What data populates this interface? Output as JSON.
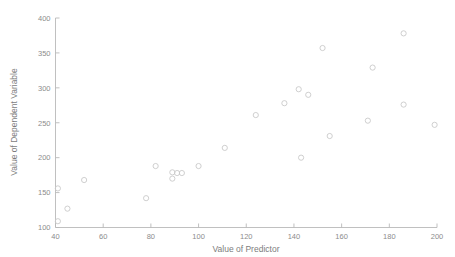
{
  "figure": {
    "background_color": "#ffffff",
    "axis_color": "#b9b9b9",
    "marker_color": "#c9c9c9",
    "tick_label_color": "#8c8c8c"
  },
  "chart_data": {
    "type": "scatter",
    "title": "",
    "xlabel": "Value of Predictor",
    "ylabel": "Value of Dependent Variable",
    "xlim": [
      40,
      200
    ],
    "ylim": [
      100,
      400
    ],
    "xticks": [
      40,
      60,
      80,
      100,
      120,
      140,
      160,
      180,
      200
    ],
    "xtick_labels": [
      "40",
      "60",
      "80",
      "100",
      "120",
      "140",
      "160",
      "180",
      "200"
    ],
    "yticks": [
      100,
      150,
      200,
      250,
      300,
      350,
      400
    ],
    "ytick_labels": [
      "100",
      "150",
      "200",
      "250",
      "300",
      "350",
      "400"
    ],
    "grid": false,
    "legend": false,
    "marker_style": "open-circle",
    "points": [
      {
        "x": 41,
        "y": 109
      },
      {
        "x": 41,
        "y": 156
      },
      {
        "x": 45,
        "y": 127
      },
      {
        "x": 52,
        "y": 168
      },
      {
        "x": 78,
        "y": 142
      },
      {
        "x": 82,
        "y": 188
      },
      {
        "x": 89,
        "y": 170
      },
      {
        "x": 89,
        "y": 179
      },
      {
        "x": 91,
        "y": 178
      },
      {
        "x": 93,
        "y": 178
      },
      {
        "x": 100,
        "y": 188
      },
      {
        "x": 111,
        "y": 214
      },
      {
        "x": 124,
        "y": 261
      },
      {
        "x": 136,
        "y": 278
      },
      {
        "x": 142,
        "y": 298
      },
      {
        "x": 143,
        "y": 200
      },
      {
        "x": 146,
        "y": 290
      },
      {
        "x": 152,
        "y": 357
      },
      {
        "x": 155,
        "y": 231
      },
      {
        "x": 171,
        "y": 253
      },
      {
        "x": 173,
        "y": 329
      },
      {
        "x": 186,
        "y": 378
      },
      {
        "x": 186,
        "y": 276
      },
      {
        "x": 199,
        "y": 247
      }
    ]
  }
}
